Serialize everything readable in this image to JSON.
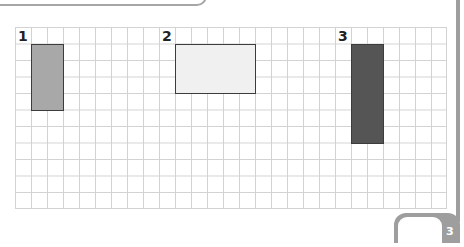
{
  "figure": {
    "grid": {
      "columns": 27,
      "rows": 11,
      "line_color": "#d2d2d2"
    },
    "shapes": [
      {
        "label": "1",
        "label_col": 0,
        "col": 1,
        "row": 1,
        "width_cells": 2,
        "height_cells": 4,
        "fill": "#a8a8a8"
      },
      {
        "label": "2",
        "label_col": 9,
        "col": 10,
        "row": 1,
        "width_cells": 5,
        "height_cells": 3,
        "fill": "#f0f0f0"
      },
      {
        "label": "3",
        "label_col": 20,
        "col": 21,
        "row": 1,
        "width_cells": 2,
        "height_cells": 6,
        "fill": "#555555"
      }
    ]
  },
  "page": {
    "number": "3"
  }
}
